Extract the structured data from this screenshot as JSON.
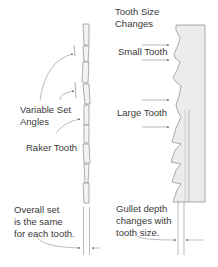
{
  "labels": {
    "tooth_size_changes_1": "Tooth Size",
    "tooth_size_changes_2": "Changes",
    "small_tooth": "Small Tooth",
    "large_tooth": "Large Tooth",
    "variable_set_1": "Variable Set",
    "variable_set_2": "Angles",
    "raker_tooth": "Raker Tooth",
    "overall_set_1": "Overall set",
    "overall_set_2": "is the same",
    "overall_set_3": "for each tooth.",
    "gullet_1": "Gullet depth",
    "gullet_2": "changes with",
    "gullet_3": "tooth size."
  },
  "colors": {
    "line": "#8a8a8a",
    "blade_fill": "#ececec",
    "text": "#3a3a3a"
  }
}
